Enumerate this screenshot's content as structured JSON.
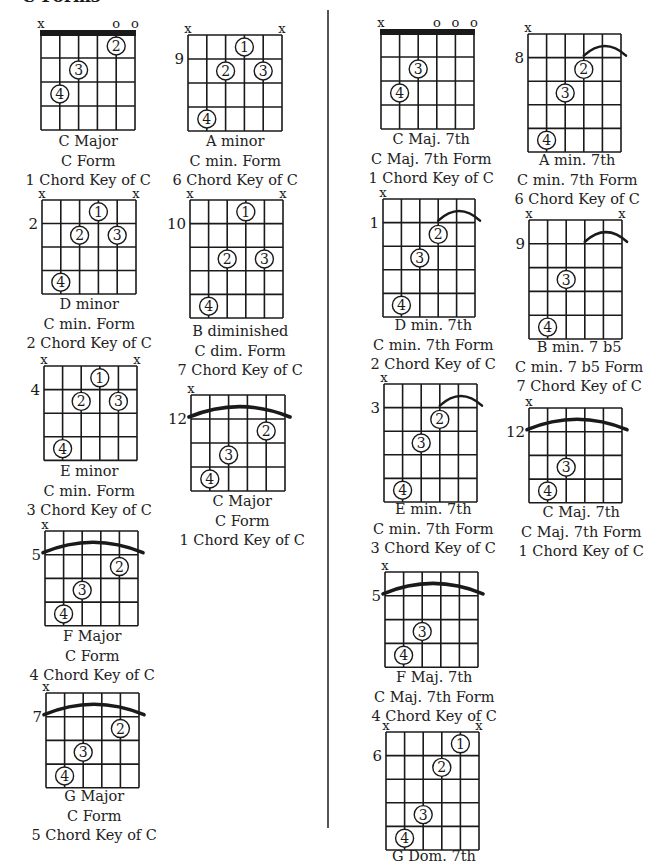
{
  "page": {
    "title": "C Forms",
    "colors": {
      "ink": "#1a1a1a",
      "divider": "#555555",
      "background": "#ffffff"
    }
  },
  "chords": [
    {
      "id": "c-major-c-form",
      "x": 41,
      "y": 34,
      "w": 94,
      "rows": 4,
      "rowH": 24,
      "nut": true,
      "fret": "",
      "markers": [
        "x",
        "",
        "",
        "",
        "o",
        "o"
      ],
      "barre": null,
      "dots": [
        {
          "s": 5,
          "f": 1,
          "n": "2"
        },
        {
          "s": 3,
          "f": 2,
          "n": "3"
        },
        {
          "s": 2,
          "f": 3,
          "n": "4"
        }
      ],
      "caption": [
        "C Major",
        "C Form",
        "1 Chord Key of C"
      ],
      "capX": 88,
      "capY": 132
    },
    {
      "id": "a-minor",
      "x": 188,
      "y": 35,
      "w": 94,
      "rows": 4,
      "rowH": 24,
      "nut": false,
      "fret": "9",
      "fretRow": 1,
      "markers": [
        "x",
        "",
        "",
        "",
        "",
        "x"
      ],
      "barre": null,
      "dots": [
        {
          "s": 4,
          "f": 1,
          "n": "1"
        },
        {
          "s": 3,
          "f": 2,
          "n": "2"
        },
        {
          "s": 5,
          "f": 2,
          "n": "3"
        },
        {
          "s": 2,
          "f": 4,
          "n": "4"
        }
      ],
      "caption": [
        "A minor",
        "C min. Form",
        "6 Chord Key of C"
      ],
      "capX": 235,
      "capY": 132
    },
    {
      "id": "d-minor",
      "x": 42,
      "y": 200,
      "w": 94,
      "rows": 4,
      "rowH": 23.5,
      "nut": false,
      "fret": "2",
      "fretRow": 1,
      "markers": [
        "x",
        "",
        "",
        "",
        "",
        "x"
      ],
      "barre": null,
      "dots": [
        {
          "s": 4,
          "f": 1,
          "n": "1"
        },
        {
          "s": 3,
          "f": 2,
          "n": "2"
        },
        {
          "s": 5,
          "f": 2,
          "n": "3"
        },
        {
          "s": 2,
          "f": 4,
          "n": "4"
        }
      ],
      "caption": [
        "D minor",
        "C min. Form",
        "2 Chord Key of C"
      ],
      "capX": 89,
      "capY": 295
    },
    {
      "id": "b-diminished",
      "x": 190,
      "y": 200,
      "w": 93,
      "rows": 5,
      "rowH": 23.6,
      "nut": false,
      "fret": "10",
      "fretRow": 1,
      "markers": [
        "x",
        "",
        "",
        "",
        "",
        "x"
      ],
      "barre": null,
      "dots": [
        {
          "s": 4,
          "f": 1,
          "n": "1"
        },
        {
          "s": 3,
          "f": 3,
          "n": "2"
        },
        {
          "s": 5,
          "f": 3,
          "n": "3"
        },
        {
          "s": 2,
          "f": 5,
          "n": "4"
        }
      ],
      "caption": [
        "B diminished",
        "C dim. Form",
        "7 Chord Key of C"
      ],
      "capX": 240,
      "capY": 322
    },
    {
      "id": "e-minor",
      "x": 44,
      "y": 366,
      "w": 93,
      "rows": 4,
      "rowH": 23.6,
      "nut": false,
      "fret": "4",
      "fretRow": 1,
      "markers": [
        "x",
        "",
        "",
        "",
        "",
        "x"
      ],
      "barre": null,
      "dots": [
        {
          "s": 4,
          "f": 1,
          "n": "1"
        },
        {
          "s": 3,
          "f": 2,
          "n": "2"
        },
        {
          "s": 5,
          "f": 2,
          "n": "3"
        },
        {
          "s": 2,
          "f": 4,
          "n": "4"
        }
      ],
      "caption": [
        "E minor",
        "C min. Form",
        "3 Chord Key of C"
      ],
      "capX": 89,
      "capY": 462
    },
    {
      "id": "c-major-12",
      "x": 191,
      "y": 395,
      "w": 94,
      "rows": 4,
      "rowH": 24,
      "nut": false,
      "fret": "12",
      "fretRow": 1,
      "markers": [
        "x",
        "",
        "",
        "",
        "",
        ""
      ],
      "barre": {
        "from": 1,
        "to": 6,
        "row": 1
      },
      "dots": [
        {
          "s": 5,
          "f": 2,
          "n": "2"
        },
        {
          "s": 3,
          "f": 3,
          "n": "3"
        },
        {
          "s": 2,
          "f": 4,
          "n": "4"
        }
      ],
      "caption": [
        "C Major",
        "C Form",
        "1 Chord Key of C"
      ],
      "capX": 242,
      "capY": 492
    },
    {
      "id": "f-major",
      "x": 45,
      "y": 531,
      "w": 93,
      "rows": 4,
      "rowH": 23.7,
      "nut": false,
      "fret": "5",
      "fretRow": 1,
      "markers": [
        "x",
        "",
        "",
        "",
        "",
        ""
      ],
      "barre": {
        "from": 1,
        "to": 6,
        "row": 1
      },
      "dots": [
        {
          "s": 5,
          "f": 2,
          "n": "2"
        },
        {
          "s": 3,
          "f": 3,
          "n": "3"
        },
        {
          "s": 2,
          "f": 4,
          "n": "4"
        }
      ],
      "caption": [
        "F Major",
        "C Form",
        "4 Chord Key of C"
      ],
      "capX": 92,
      "capY": 627
    },
    {
      "id": "g-major",
      "x": 46,
      "y": 693,
      "w": 93,
      "rows": 4,
      "rowH": 23.7,
      "nut": false,
      "fret": "7",
      "fretRow": 1,
      "markers": [
        "x",
        "",
        "",
        "",
        "",
        ""
      ],
      "barre": {
        "from": 1,
        "to": 6,
        "row": 1
      },
      "dots": [
        {
          "s": 5,
          "f": 2,
          "n": "2"
        },
        {
          "s": 3,
          "f": 3,
          "n": "3"
        },
        {
          "s": 2,
          "f": 4,
          "n": "4"
        }
      ],
      "caption": [
        "G Major",
        "C Form",
        "5 Chord Key of C"
      ],
      "capX": 94,
      "capY": 787
    },
    {
      "id": "c-maj7",
      "x": 381,
      "y": 33,
      "w": 93,
      "rows": 4,
      "rowH": 24,
      "nut": true,
      "fret": "",
      "markers": [
        "x",
        "",
        "",
        "o",
        "o",
        "o"
      ],
      "barre": null,
      "dots": [
        {
          "s": 3,
          "f": 2,
          "n": "3"
        },
        {
          "s": 2,
          "f": 3,
          "n": "4"
        }
      ],
      "caption": [
        "C Maj. 7th",
        "C Maj. 7th Form",
        "1 Chord Key of C"
      ],
      "capX": 431,
      "capY": 130
    },
    {
      "id": "a-min7",
      "x": 528,
      "y": 34,
      "w": 93,
      "rows": 5,
      "rowH": 23.6,
      "nut": false,
      "fret": "8",
      "fretRow": 1,
      "markers": [
        "x",
        "",
        "",
        "",
        "",
        ""
      ],
      "barre": {
        "from": 4,
        "to": 6,
        "row": 1
      },
      "dots": [
        {
          "s": 4,
          "f": 2,
          "n": "2"
        },
        {
          "s": 3,
          "f": 3,
          "n": "3"
        },
        {
          "s": 2,
          "f": 5,
          "n": "4"
        }
      ],
      "caption": [
        "A min. 7th",
        "C min. 7th Form",
        "6 Chord Key of C"
      ],
      "capX": 577,
      "capY": 151
    },
    {
      "id": "d-min7",
      "x": 383,
      "y": 199,
      "w": 92,
      "rows": 5,
      "rowH": 23.6,
      "nut": false,
      "fret": "1",
      "fretRow": 1,
      "markers": [
        "x",
        "",
        "",
        "",
        "",
        ""
      ],
      "barre": {
        "from": 4,
        "to": 6,
        "row": 1
      },
      "dots": [
        {
          "s": 4,
          "f": 2,
          "n": "2"
        },
        {
          "s": 3,
          "f": 3,
          "n": "3"
        },
        {
          "s": 2,
          "f": 5,
          "n": "4"
        }
      ],
      "caption": [
        "D min. 7th",
        "C min. 7th Form",
        "2 Chord Key of C"
      ],
      "capX": 433,
      "capY": 316
    },
    {
      "id": "b-min7b5",
      "x": 529,
      "y": 220,
      "w": 93,
      "rows": 5,
      "rowH": 23.8,
      "nut": false,
      "fret": "9",
      "fretRow": 1,
      "markers": [
        "x",
        "",
        "",
        "",
        "",
        "x"
      ],
      "barre": {
        "from": 4,
        "to": 6,
        "row": 1
      },
      "dots": [
        {
          "s": 3,
          "f": 3,
          "n": "3"
        },
        {
          "s": 2,
          "f": 5,
          "n": "4"
        }
      ],
      "caption": [
        "B min. 7 b5",
        "C min. 7 b5 Form",
        "7 Chord Key of C"
      ],
      "capX": 579,
      "capY": 338
    },
    {
      "id": "e-min7",
      "x": 384,
      "y": 384,
      "w": 93,
      "rows": 5,
      "rowH": 23.6,
      "nut": false,
      "fret": "3",
      "fretRow": 1,
      "markers": [
        "x",
        "",
        "",
        "",
        "",
        ""
      ],
      "barre": {
        "from": 4,
        "to": 6,
        "row": 1
      },
      "dots": [
        {
          "s": 4,
          "f": 2,
          "n": "2"
        },
        {
          "s": 3,
          "f": 3,
          "n": "3"
        },
        {
          "s": 2,
          "f": 5,
          "n": "4"
        }
      ],
      "caption": [
        "E min. 7th",
        "C min. 7th Form",
        "3 Chord Key of C"
      ],
      "capX": 433,
      "capY": 500
    },
    {
      "id": "c-maj7-12",
      "x": 529,
      "y": 408,
      "w": 93,
      "rows": 4,
      "rowH": 23.7,
      "nut": false,
      "fret": "12",
      "fretRow": 1,
      "markers": [
        "x",
        "",
        "",
        "",
        "",
        ""
      ],
      "barre": {
        "from": 1,
        "to": 6,
        "row": 1
      },
      "dots": [
        {
          "s": 3,
          "f": 3,
          "n": "3"
        },
        {
          "s": 2,
          "f": 4,
          "n": "4"
        }
      ],
      "caption": [
        "C Maj. 7th",
        "C Maj. 7th Form",
        "1 Chord Key of C"
      ],
      "capX": 581,
      "capY": 503
    },
    {
      "id": "f-maj7",
      "x": 385,
      "y": 572,
      "w": 93,
      "rows": 4,
      "rowH": 23.8,
      "nut": false,
      "fret": "5",
      "fretRow": 1,
      "markers": [
        "x",
        "",
        "",
        "",
        "",
        ""
      ],
      "barre": {
        "from": 1,
        "to": 6,
        "row": 1
      },
      "dots": [
        {
          "s": 3,
          "f": 3,
          "n": "3"
        },
        {
          "s": 2,
          "f": 4,
          "n": "4"
        }
      ],
      "caption": [
        "F Maj. 7th",
        "C Maj. 7th Form",
        "4 Chord Key of C"
      ],
      "capX": 434,
      "capY": 668
    },
    {
      "id": "g-dom7",
      "x": 386,
      "y": 732,
      "w": 93,
      "rows": 5,
      "rowH": 23.6,
      "nut": false,
      "fret": "6",
      "fretRow": 1,
      "markers": [
        "x",
        "",
        "",
        "",
        "",
        "x"
      ],
      "barre": null,
      "dots": [
        {
          "s": 5,
          "f": 1,
          "n": "1"
        },
        {
          "s": 4,
          "f": 2,
          "n": "2"
        },
        {
          "s": 3,
          "f": 4,
          "n": "3"
        },
        {
          "s": 2,
          "f": 5,
          "n": "4"
        }
      ],
      "caption": [
        "G Dom. 7th"
      ],
      "capX": 434,
      "capY": 847
    }
  ]
}
